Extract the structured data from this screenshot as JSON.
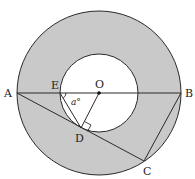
{
  "diagram": {
    "type": "geometry",
    "colors": {
      "annulus_fill": "#c9c9c9",
      "inner_fill": "#ffffff",
      "stroke": "#2a2a2a"
    },
    "points": {
      "A": {
        "label": "A",
        "x": 17,
        "y": 93
      },
      "B": {
        "label": "B",
        "x": 181,
        "y": 93
      },
      "C": {
        "label": "C",
        "x": 144,
        "y": 161
      },
      "D": {
        "label": "D",
        "x": 81,
        "y": 128
      },
      "E": {
        "label": "E",
        "x": 60,
        "y": 93
      },
      "O": {
        "label": "O",
        "x": 99,
        "y": 93
      }
    },
    "circles": [
      {
        "name": "outer",
        "cx": 99,
        "cy": 93,
        "r": 82
      },
      {
        "name": "inner",
        "cx": 99,
        "cy": 93,
        "r": 39
      }
    ],
    "segments": [
      "AB",
      "AC",
      "BC",
      "ED",
      "OD"
    ],
    "angle_label": "a°",
    "angle_at": "E",
    "right_angle_at": "D"
  }
}
